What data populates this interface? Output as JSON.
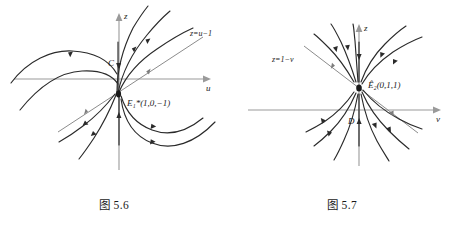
{
  "page": {
    "background": "#ffffff",
    "curve_color": "#2a2a2a",
    "axis_color": "#9a9a9a",
    "separatrix_color": "#8c8c8c"
  },
  "figures": [
    {
      "id": "figure-5-6",
      "caption": "图 5.6",
      "axis_vertical_label": "z",
      "axis_horizontal_label": "u",
      "line_label": "z=u−1",
      "equilibrium_label": "E₁*(1,0,−1)",
      "region_label": "C",
      "type": "phase-portrait",
      "description": "degenerate equilibrium with invariant line z=u-1"
    },
    {
      "id": "figure-5-7",
      "caption": "图 5.7",
      "axis_vertical_label": "z",
      "axis_horizontal_label": "v",
      "line_label": "z=1−v",
      "equilibrium_label": "Ê₂(0,1,1)",
      "region_label": "D",
      "type": "phase-portrait",
      "description": "node-like equilibrium with invariant line z=1-v"
    }
  ]
}
